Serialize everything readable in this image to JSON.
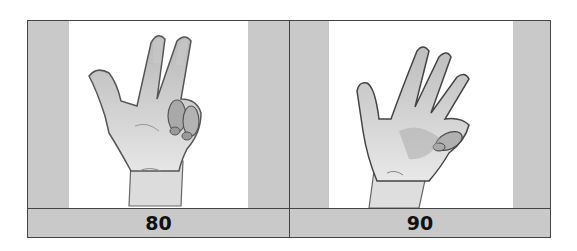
{
  "table": {
    "cells": [
      {
        "image": "hand-sign-80-icon",
        "description": "hand with thumb, index and middle finger extended, ring and pinky curled",
        "label": "80"
      },
      {
        "image": "hand-sign-90-icon",
        "description": "open hand with four fingers extended and pinky folded",
        "label": "90"
      }
    ],
    "colors": {
      "cell_bg": "#c9c9c9",
      "image_bg": "#ffffff",
      "border": "#444444",
      "label_text": "#111111"
    }
  }
}
